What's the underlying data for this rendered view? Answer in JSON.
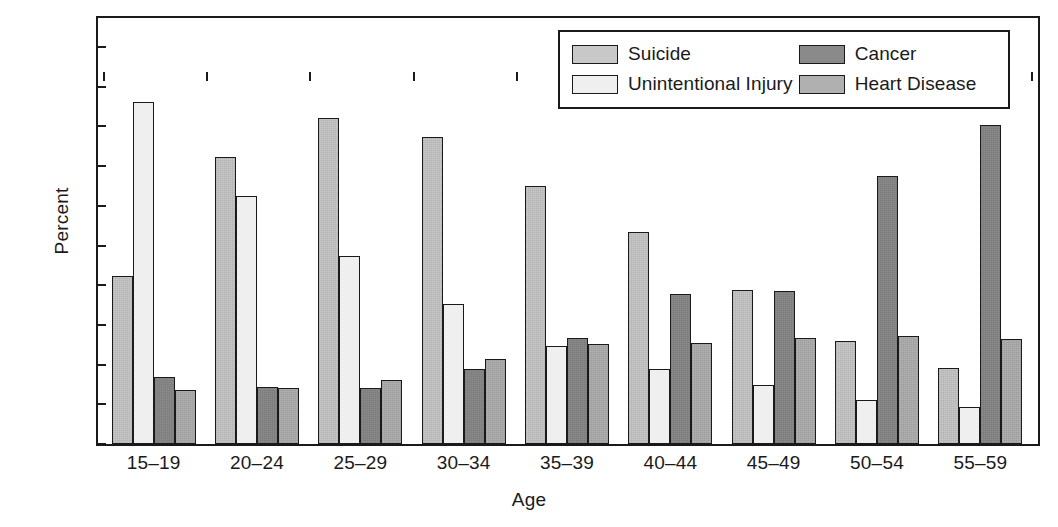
{
  "chart_data": {
    "type": "bar",
    "title": "",
    "xlabel": "Age",
    "ylabel": "Percent",
    "ylim": [
      0,
      50
    ],
    "yticks": [
      0,
      5,
      10,
      15,
      20,
      25,
      30,
      35,
      40,
      45,
      50
    ],
    "grid": false,
    "legend_position": "top-right",
    "categories": [
      "15–19",
      "20–24",
      "25–29",
      "30–34",
      "35–39",
      "40–44",
      "45–49",
      "50–54",
      "55–59"
    ],
    "series": [
      {
        "name": "Suicide",
        "color": "#c8c8c8",
        "values": [
          21.2,
          36.2,
          41.1,
          38.7,
          32.5,
          26.7,
          19.4,
          13.0,
          9.6
        ]
      },
      {
        "name": "Unintentional Injury",
        "color": "#efefef",
        "values": [
          43.1,
          31.2,
          23.7,
          17.6,
          12.3,
          9.5,
          7.4,
          5.6,
          4.7
        ]
      },
      {
        "name": "Cancer",
        "color": "#8a8a8a",
        "values": [
          8.4,
          7.2,
          7.1,
          9.5,
          13.3,
          18.9,
          19.3,
          33.7,
          40.2
        ]
      },
      {
        "name": "Heart Disease",
        "color": "#b0b0b0",
        "values": [
          6.8,
          7.1,
          8.0,
          10.7,
          12.6,
          12.7,
          13.4,
          13.6,
          13.2
        ]
      }
    ]
  },
  "axes": {
    "y_title": "Percent",
    "x_title": "Age",
    "y_tick_labels": [
      "0",
      "5",
      "10",
      "15",
      "20",
      "25",
      "30",
      "35",
      "40",
      "45",
      "50"
    ],
    "x_tick_labels": [
      "15–19",
      "20–24",
      "25–29",
      "30–34",
      "35–39",
      "40–44",
      "45–49",
      "50–54",
      "55–59"
    ]
  },
  "legend": {
    "entries": [
      {
        "label": "Suicide",
        "color": "#c8c8c8"
      },
      {
        "label": "Cancer",
        "color": "#8a8a8a"
      },
      {
        "label": "Unintentional Injury",
        "color": "#efefef"
      },
      {
        "label": "Heart Disease",
        "color": "#b0b0b0"
      }
    ]
  }
}
